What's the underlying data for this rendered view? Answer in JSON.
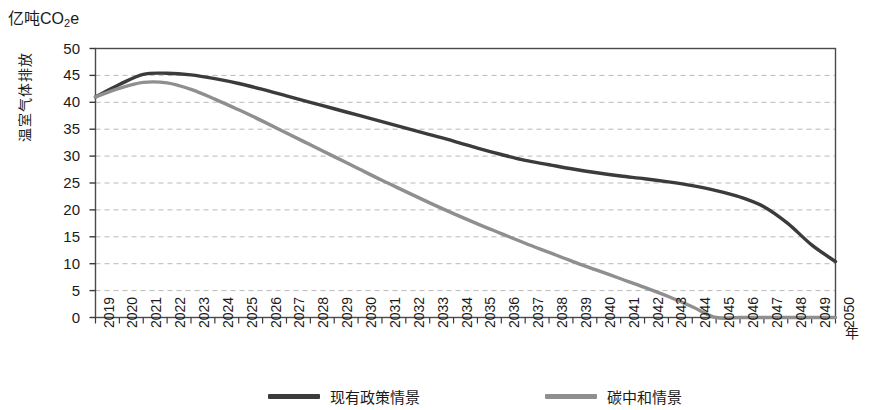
{
  "unit_label": "亿吨CO",
  "unit_label_sub": "2",
  "unit_label_tail": "e",
  "axes": {
    "y_title": "温室气体排放",
    "x_title": "年"
  },
  "legend": {
    "items": [
      {
        "label": "现有政策情景",
        "color": "#3b3b3b"
      },
      {
        "label": "碳中和情景",
        "color": "#8f8f8f"
      }
    ]
  },
  "chart_data": {
    "type": "line",
    "title": "",
    "subtitle": "",
    "xlabel": "年",
    "ylabel": "温室气体排放",
    "unit": "亿吨CO2e",
    "grid": true,
    "legend_position": "bottom",
    "xlim": [
      2019,
      2050
    ],
    "ylim": [
      0,
      50
    ],
    "ytick_labels": [
      "50",
      "45",
      "40",
      "35",
      "30",
      "25",
      "20",
      "15",
      "10",
      "5",
      "0"
    ],
    "yticks": [
      50,
      45,
      40,
      35,
      30,
      25,
      20,
      15,
      10,
      5,
      0
    ],
    "categories": [
      "2019",
      "2020",
      "2021",
      "2022",
      "2023",
      "2024",
      "2025",
      "2026",
      "2027",
      "2028",
      "2029",
      "2030",
      "2031",
      "2032",
      "2033",
      "2034",
      "2035",
      "2036",
      "2037",
      "2038",
      "2039",
      "2040",
      "2041",
      "2042",
      "2043",
      "2044",
      "2045",
      "2046",
      "2047",
      "2048",
      "2049",
      "2050"
    ],
    "x": [
      2019,
      2020,
      2021,
      2022,
      2023,
      2024,
      2025,
      2026,
      2027,
      2028,
      2029,
      2030,
      2031,
      2032,
      2033,
      2034,
      2035,
      2036,
      2037,
      2038,
      2039,
      2040,
      2041,
      2042,
      2043,
      2044,
      2045,
      2046,
      2047,
      2048,
      2049,
      2050
    ],
    "series": [
      {
        "name": "现有政策情景",
        "color": "#3b3b3b",
        "values": [
          41.0,
          43.3,
          45.2,
          45.4,
          45.1,
          44.4,
          43.5,
          42.4,
          41.2,
          40.0,
          38.8,
          37.6,
          36.4,
          35.2,
          34.0,
          32.8,
          31.5,
          30.3,
          29.2,
          28.4,
          27.6,
          26.9,
          26.3,
          25.8,
          25.2,
          24.5,
          23.6,
          22.4,
          20.6,
          17.5,
          13.5,
          10.4
        ]
      },
      {
        "name": "碳中和情景",
        "color": "#8f8f8f",
        "values": [
          41.0,
          42.6,
          43.7,
          43.6,
          42.4,
          40.6,
          38.6,
          36.5,
          34.3,
          32.1,
          29.9,
          27.7,
          25.5,
          23.4,
          21.3,
          19.3,
          17.4,
          15.6,
          13.8,
          12.1,
          10.4,
          8.8,
          7.2,
          5.6,
          3.9,
          2.0,
          0.0,
          0.0,
          0.0,
          0.0,
          0.0,
          0.0
        ]
      }
    ]
  }
}
